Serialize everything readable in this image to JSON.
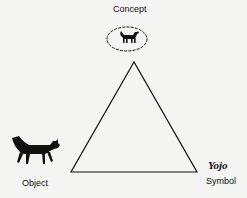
{
  "diagram": {
    "type": "semiotic-triangle",
    "nodes": {
      "concept": {
        "label": "Concept",
        "icon": "cat-in-thought-bubble-icon"
      },
      "object": {
        "label": "Object",
        "icon": "cat-silhouette-icon"
      },
      "symbol": {
        "label": "Symbol",
        "word": "Yojo"
      }
    },
    "edges": [
      {
        "from": "concept",
        "to": "object"
      },
      {
        "from": "concept",
        "to": "symbol"
      },
      {
        "from": "object",
        "to": "symbol"
      }
    ],
    "colors": {
      "line": "#111111",
      "background": "#f4f4f2"
    }
  }
}
